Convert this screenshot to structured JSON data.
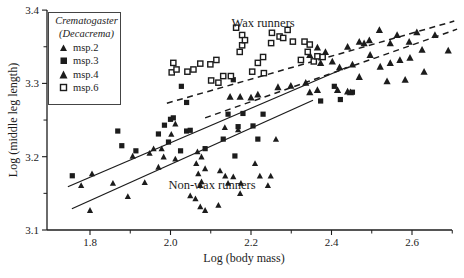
{
  "figure": {
    "background": "#ffffff",
    "ink_color": "#1c1c1c"
  },
  "chart_data": {
    "type": "scatter",
    "title": "",
    "xlabel": "Log (body mass)",
    "ylabel": "Log (middle leg length)",
    "xlim": [
      1.69,
      2.72
    ],
    "ylim": [
      3.1,
      3.4
    ],
    "x_major_ticks": [
      1.8,
      2.0,
      2.2,
      2.4,
      2.6
    ],
    "x_minor_ticks": [
      1.9,
      2.1,
      2.3,
      2.5,
      2.7
    ],
    "y_major_ticks": [
      3.1,
      3.2,
      3.3,
      3.4
    ],
    "y_minor_ticks": [
      3.15,
      3.25,
      3.35
    ],
    "grid": false,
    "legend": {
      "position": "top-left",
      "title_line1": "Crematogaster",
      "title_line2": "(Decacrema)",
      "items": [
        {
          "label": "msp.2",
          "marker": "triangle-filled-small"
        },
        {
          "label": "msp.3",
          "marker": "square-filled"
        },
        {
          "label": "msp.4",
          "marker": "triangle-filled"
        },
        {
          "label": "msp.6",
          "marker": "square-open"
        }
      ]
    },
    "annotations": [
      {
        "text": "Wax runners",
        "x": 2.23,
        "y": 3.381
      },
      {
        "text": "Non-wax runners",
        "x": 2.103,
        "y": 3.16
      }
    ],
    "trend_lines": [
      {
        "series": "msp.2",
        "group": "non-wax runners",
        "style": "solid",
        "x1": 1.755,
        "y1": 3.129,
        "x2": 2.354,
        "y2": 3.277
      },
      {
        "series": "msp.3",
        "group": "non-wax runners",
        "style": "solid",
        "x1": 1.745,
        "y1": 3.159,
        "x2": 2.438,
        "y2": 3.322
      },
      {
        "series": "msp.4",
        "group": "wax runners",
        "style": "dashed",
        "x1": 2.086,
        "y1": 3.253,
        "x2": 2.712,
        "y2": 3.374
      },
      {
        "series": "msp.6",
        "group": "wax runners",
        "style": "dashed",
        "x1": 1.991,
        "y1": 3.273,
        "x2": 2.705,
        "y2": 3.385
      }
    ],
    "series": [
      {
        "name": "msp.2",
        "marker": "triangle-filled-small",
        "group": "non-wax runners",
        "points": [
          [
            1.778,
            3.161
          ],
          [
            1.805,
            3.177
          ],
          [
            1.8,
            3.127
          ],
          [
            1.857,
            3.164
          ],
          [
            1.894,
            3.146
          ],
          [
            1.906,
            3.201
          ],
          [
            1.936,
            3.165
          ],
          [
            1.948,
            3.205
          ],
          [
            1.958,
            3.211
          ],
          [
            1.97,
            3.186
          ],
          [
            1.978,
            3.211
          ],
          [
            1.983,
            3.2
          ],
          [
            2.002,
            3.231
          ],
          [
            2.012,
            3.245
          ],
          [
            2.012,
            3.197
          ],
          [
            2.049,
            3.147
          ],
          [
            2.062,
            3.143
          ],
          [
            2.064,
            3.191
          ],
          [
            2.067,
            3.207
          ],
          [
            2.069,
            3.177
          ],
          [
            2.074,
            3.161
          ],
          [
            2.074,
            3.132
          ],
          [
            2.077,
            3.2
          ],
          [
            2.077,
            3.166
          ],
          [
            2.086,
            3.127
          ],
          [
            2.086,
            3.184
          ],
          [
            2.119,
            3.134
          ],
          [
            2.123,
            3.181
          ],
          [
            2.135,
            3.24
          ],
          [
            2.136,
            3.174
          ],
          [
            2.143,
            3.164
          ],
          [
            2.156,
            3.173
          ],
          [
            2.168,
            3.237
          ],
          [
            2.173,
            3.15
          ],
          [
            2.175,
            3.164
          ],
          [
            2.21,
            3.191
          ],
          [
            2.222,
            3.174
          ],
          [
            2.242,
            3.161
          ],
          [
            2.249,
            3.174
          ],
          [
            2.262,
            3.224
          ]
        ]
      },
      {
        "name": "msp.3",
        "marker": "square-filled",
        "group": "non-wax runners",
        "points": [
          [
            1.756,
            3.174
          ],
          [
            1.869,
            3.235
          ],
          [
            1.879,
            3.215
          ],
          [
            1.914,
            3.208
          ],
          [
            1.97,
            3.231
          ],
          [
            1.985,
            3.243
          ],
          [
            1.995,
            3.22
          ],
          [
            2.0,
            3.251
          ],
          [
            2.007,
            3.253
          ],
          [
            2.025,
            3.208
          ],
          [
            2.027,
            3.296
          ],
          [
            2.04,
            3.235
          ],
          [
            2.04,
            3.274
          ],
          [
            2.049,
            3.236
          ],
          [
            2.086,
            3.211
          ],
          [
            2.131,
            3.224
          ],
          [
            2.143,
            3.258
          ],
          [
            2.156,
            3.305
          ],
          [
            2.16,
            3.201
          ],
          [
            2.168,
            3.241
          ],
          [
            2.18,
            3.259
          ],
          [
            2.205,
            3.242
          ],
          [
            2.217,
            3.224
          ],
          [
            2.23,
            3.258
          ],
          [
            2.373,
            3.276
          ],
          [
            2.407,
            3.296
          ],
          [
            2.422,
            3.278
          ],
          [
            2.452,
            3.288
          ]
        ]
      },
      {
        "name": "msp.4",
        "marker": "triangle-filled",
        "group": "wax runners",
        "points": [
          [
            2.148,
            3.282
          ],
          [
            2.173,
            3.282
          ],
          [
            2.2,
            3.281
          ],
          [
            2.217,
            3.285
          ],
          [
            2.267,
            3.295
          ],
          [
            2.299,
            3.297
          ],
          [
            2.336,
            3.301
          ],
          [
            2.346,
            3.288
          ],
          [
            2.346,
            3.339
          ],
          [
            2.365,
            3.349
          ],
          [
            2.365,
            3.291
          ],
          [
            2.373,
            3.328
          ],
          [
            2.385,
            3.343
          ],
          [
            2.402,
            3.33
          ],
          [
            2.415,
            3.291
          ],
          [
            2.42,
            3.322
          ],
          [
            2.44,
            3.35
          ],
          [
            2.44,
            3.289
          ],
          [
            2.447,
            3.288
          ],
          [
            2.452,
            3.326
          ],
          [
            2.469,
            3.357
          ],
          [
            2.469,
            3.309
          ],
          [
            2.481,
            3.355
          ],
          [
            2.494,
            3.359
          ],
          [
            2.496,
            3.339
          ],
          [
            2.519,
            3.373
          ],
          [
            2.521,
            3.323
          ],
          [
            2.538,
            3.303
          ],
          [
            2.546,
            3.355
          ],
          [
            2.546,
            3.328
          ],
          [
            2.563,
            3.366
          ],
          [
            2.57,
            3.332
          ],
          [
            2.583,
            3.305
          ],
          [
            2.593,
            3.357
          ],
          [
            2.595,
            3.335
          ],
          [
            2.612,
            3.37
          ],
          [
            2.625,
            3.346
          ],
          [
            2.63,
            3.316
          ],
          [
            2.657,
            3.366
          ],
          [
            2.69,
            3.345
          ]
        ]
      },
      {
        "name": "msp.6",
        "marker": "square-open",
        "group": "wax runners",
        "points": [
          [
            2.003,
            3.315
          ],
          [
            2.007,
            3.328
          ],
          [
            2.015,
            3.319
          ],
          [
            2.042,
            3.316
          ],
          [
            2.057,
            3.319
          ],
          [
            2.074,
            3.327
          ],
          [
            2.099,
            3.326
          ],
          [
            2.101,
            3.304
          ],
          [
            2.114,
            3.332
          ],
          [
            2.119,
            3.301
          ],
          [
            2.131,
            3.31
          ],
          [
            2.15,
            3.31
          ],
          [
            2.163,
            3.376
          ],
          [
            2.172,
            3.343
          ],
          [
            2.178,
            3.366
          ],
          [
            2.178,
            3.352
          ],
          [
            2.185,
            3.359
          ],
          [
            2.203,
            3.316
          ],
          [
            2.217,
            3.328
          ],
          [
            2.23,
            3.336
          ],
          [
            2.232,
            3.314
          ],
          [
            2.25,
            3.355
          ],
          [
            2.252,
            3.369
          ],
          [
            2.271,
            3.364
          ],
          [
            2.28,
            3.362
          ],
          [
            2.291,
            3.373
          ],
          [
            2.304,
            3.357
          ],
          [
            2.324,
            3.332
          ],
          [
            2.333,
            3.357
          ],
          [
            2.341,
            3.343
          ],
          [
            2.346,
            3.353
          ],
          [
            2.356,
            3.33
          ],
          [
            2.365,
            3.337
          ],
          [
            2.378,
            3.336
          ]
        ]
      }
    ]
  }
}
